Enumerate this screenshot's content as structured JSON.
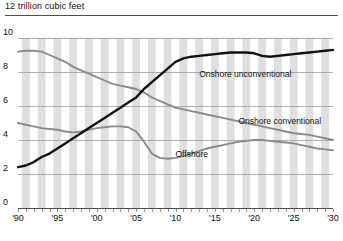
{
  "chart_data": {
    "type": "line",
    "title": "12 trillion cubic feet",
    "xlabel": "",
    "ylabel": "",
    "ylim": [
      0,
      10
    ],
    "xlim": [
      1990,
      2030
    ],
    "grid": true,
    "legend_position": "inline-annotations",
    "y_ticks": [
      "0",
      "2",
      "4",
      "6",
      "8",
      "10"
    ],
    "y_tick_values": [
      0,
      2,
      4,
      6,
      8,
      10
    ],
    "x_ticks": [
      "'90",
      "'95",
      "'00",
      "'05",
      "'10",
      "'15",
      "'20",
      "'25",
      "'30"
    ],
    "x_tick_values": [
      1990,
      1995,
      2000,
      2005,
      2010,
      2015,
      2020,
      2025,
      2030
    ],
    "x": [
      1990,
      1991,
      1992,
      1993,
      1994,
      1995,
      1996,
      1997,
      1998,
      1999,
      2000,
      2001,
      2002,
      2003,
      2004,
      2005,
      2006,
      2007,
      2008,
      2009,
      2010,
      2011,
      2012,
      2013,
      2014,
      2015,
      2016,
      2017,
      2018,
      2019,
      2020,
      2021,
      2022,
      2023,
      2024,
      2025,
      2026,
      2027,
      2028,
      2029,
      2030
    ],
    "series": [
      {
        "name": "Onshore conventional",
        "color": "#8a8a8a",
        "style": "solid",
        "label_x": 2018,
        "label_y": 5.1,
        "values": [
          9.2,
          9.25,
          9.25,
          9.2,
          9.0,
          8.8,
          8.6,
          8.3,
          8.1,
          7.9,
          7.7,
          7.5,
          7.3,
          7.2,
          7.1,
          7.0,
          6.8,
          6.5,
          6.3,
          6.1,
          5.9,
          5.8,
          5.7,
          5.6,
          5.5,
          5.4,
          5.3,
          5.2,
          5.1,
          5.0,
          4.9,
          4.8,
          4.7,
          4.6,
          4.5,
          4.4,
          4.35,
          4.3,
          4.2,
          4.1,
          4.0
        ]
      },
      {
        "name": "Offshore",
        "color": "#8a8a8a",
        "style": "solid",
        "label_x": 2010,
        "label_y": 3.2,
        "values": [
          5.0,
          4.9,
          4.8,
          4.7,
          4.65,
          4.6,
          4.5,
          4.45,
          4.5,
          4.6,
          4.7,
          4.75,
          4.8,
          4.8,
          4.75,
          4.5,
          3.9,
          3.2,
          2.95,
          2.9,
          2.95,
          3.05,
          3.2,
          3.35,
          3.5,
          3.6,
          3.7,
          3.8,
          3.9,
          3.95,
          4.0,
          4.0,
          3.95,
          3.9,
          3.85,
          3.8,
          3.7,
          3.6,
          3.5,
          3.45,
          3.4
        ]
      },
      {
        "name": "Onshore unconventional",
        "color": "#111111",
        "style": "solid",
        "label_x": 2013,
        "label_y": 7.9,
        "values": [
          2.4,
          2.5,
          2.7,
          3.0,
          3.2,
          3.5,
          3.8,
          4.1,
          4.4,
          4.7,
          5.0,
          5.3,
          5.6,
          5.9,
          6.2,
          6.5,
          7.0,
          7.4,
          7.8,
          8.2,
          8.6,
          8.8,
          8.9,
          8.95,
          9.0,
          9.05,
          9.1,
          9.15,
          9.15,
          9.15,
          9.1,
          8.95,
          8.9,
          8.95,
          9.0,
          9.05,
          9.1,
          9.15,
          9.2,
          9.25,
          9.3
        ]
      }
    ]
  }
}
